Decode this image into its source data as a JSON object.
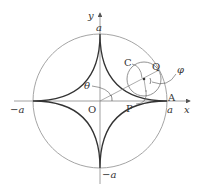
{
  "diagram": {
    "colors": {
      "curve": "#333333",
      "circle": "#9a9a9a",
      "axis": "#888888",
      "text": "#333333"
    },
    "labels": {
      "y_axis": "y",
      "x_axis": "x",
      "top_a": "a",
      "bottom_a": "−a",
      "left_a": "−a",
      "right_a": "a",
      "origin": "O",
      "point_A": "A",
      "point_C": "C",
      "point_Q": "Q",
      "point_P": "P",
      "angle_theta": "θ",
      "angle_phi": "φ"
    }
  }
}
